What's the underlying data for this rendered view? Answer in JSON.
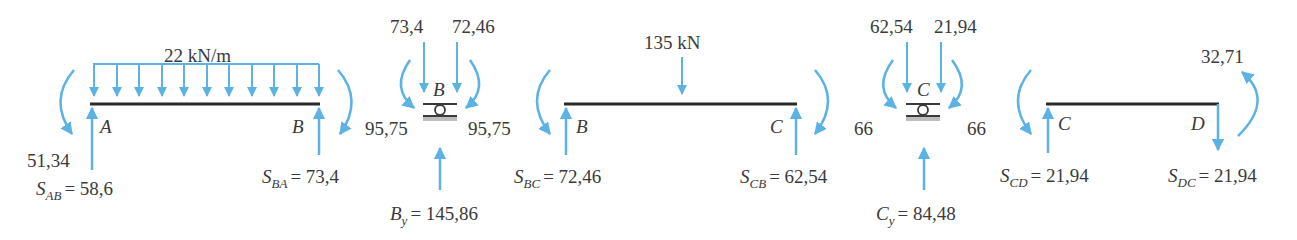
{
  "colors": {
    "arrow": "#5bb2e3",
    "beam": "#2b2b2b",
    "text": "#3a3a3a"
  },
  "segments": {
    "AB": {
      "load": "22 kN/m",
      "left_node": "A",
      "right_node": "B",
      "moment_left": "51,34",
      "shear_left": {
        "S": "S",
        "sub": "AB",
        "eq": "= 58,6"
      },
      "shear_right": {
        "S": "S",
        "sub": "BA",
        "eq": "= 73,4"
      }
    },
    "joint_B": {
      "node": "B",
      "force_left": "73,4",
      "force_right": "72,46",
      "moment_left": "95,75",
      "moment_right": "95,75",
      "reaction": {
        "S": "B",
        "sub": "y",
        "eq": "= 145,86"
      }
    },
    "BC": {
      "load": "135 kN",
      "left_node": "B",
      "right_node": "C",
      "shear_left": {
        "S": "S",
        "sub": "BC",
        "eq": "= 72,46"
      },
      "shear_right": {
        "S": "S",
        "sub": "CB",
        "eq": "= 62,54"
      }
    },
    "joint_C": {
      "node": "C",
      "force_left": "62,54",
      "force_right": "21,94",
      "moment_left": "66",
      "moment_right": "66",
      "reaction": {
        "S": "C",
        "sub": "y",
        "eq": "= 84,48"
      }
    },
    "CD": {
      "left_node": "C",
      "right_node": "D",
      "moment_right": "32,71",
      "shear_left": {
        "S": "S",
        "sub": "CD",
        "eq": "= 21,94"
      },
      "shear_right": {
        "S": "S",
        "sub": "DC",
        "eq": "= 21,94"
      }
    }
  }
}
